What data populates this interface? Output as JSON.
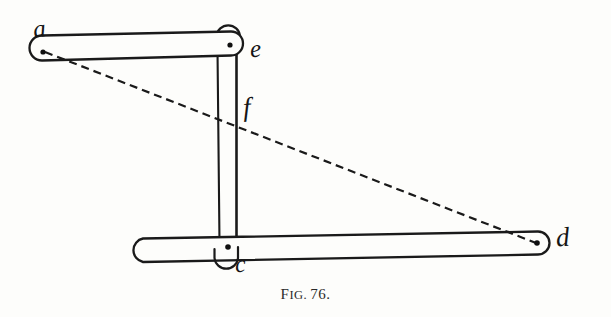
{
  "figure": {
    "caption_prefix": "F",
    "caption_prefix_rest": "IG.",
    "caption_number": "76.",
    "caption_full": "FIG. 76.",
    "ink_color": "#1a1a1a",
    "paper_color": "#fdfdfb"
  },
  "labels": {
    "a": "a",
    "c": "c",
    "d": "d",
    "e": "e",
    "f": "f"
  },
  "geometry": {
    "top_bar": {
      "name": "link-a-e",
      "left_pivot": [
        43,
        52
      ],
      "right_pivot": [
        230,
        46
      ],
      "thickness": 23
    },
    "bottom_bar": {
      "name": "link-c-d",
      "left_end": [
        142,
        250
      ],
      "right_pivot": [
        537,
        243
      ],
      "center_pivot": [
        228,
        247
      ],
      "thickness": 23
    },
    "vertical_bar": {
      "name": "link-f",
      "x_left": 217,
      "x_right": 236,
      "y_top": 52,
      "y_bottom": 242
    },
    "dashed_line": {
      "name": "construction-line-a-d",
      "from": [
        43,
        52
      ],
      "to": [
        537,
        243
      ],
      "dash": "8,5"
    },
    "hook_e": {
      "cx": 228,
      "cy": 36,
      "r": 12
    },
    "hook_c": {
      "cx": 226,
      "cy": 259,
      "r": 12
    }
  }
}
